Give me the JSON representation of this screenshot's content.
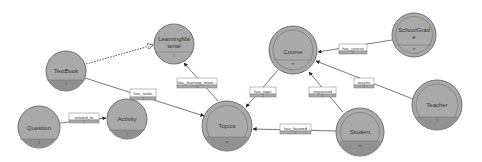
{
  "diagram": {
    "type": "entity-relationship graph",
    "colors": {
      "node_fill": "#a9a9a9",
      "node_stroke": "#6f6f6f",
      "node_bottom": "#8f8f8f",
      "edge": "#555555",
      "label_box_fill": "#ffffff",
      "label_box_stroke": "#7a7a7a"
    },
    "nodes": [
      {
        "id": "textbook",
        "label": "TextBook",
        "sub": "1",
        "double": false
      },
      {
        "id": "learningmaterial",
        "label_line1": "LearningMa",
        "label_line2": "terial",
        "sub": "1",
        "double": false
      },
      {
        "id": "course",
        "label": "Course",
        "sub": "m",
        "double": true
      },
      {
        "id": "schoolgrade",
        "label_line1": "SchoolGrad",
        "label_line2": "e",
        "sub": "m",
        "double": true
      },
      {
        "id": "question",
        "label": "Question",
        "sub": "1",
        "double": false
      },
      {
        "id": "activity",
        "label": "Activity",
        "sub": "1",
        "double": false
      },
      {
        "id": "topics",
        "label": "Topics",
        "sub": "m",
        "double": true
      },
      {
        "id": "student",
        "label": "Student",
        "sub": "m",
        "double": true
      },
      {
        "id": "teacher",
        "label": "Teacher",
        "sub": "1",
        "double": true
      }
    ],
    "edges": [
      {
        "from": "textbook",
        "to": "learningmaterial",
        "label": "",
        "style": "dashed"
      },
      {
        "from": "textbook",
        "to": "topics",
        "label": "has_tasks",
        "card": "1"
      },
      {
        "from": "question",
        "to": "activity",
        "label": "related_to",
        "card": "1"
      },
      {
        "from": "topics",
        "to": "learningmaterial",
        "label": "has_learning_mate...",
        "card": "1"
      },
      {
        "from": "course",
        "to": "topics",
        "label": "has_topic",
        "card": "1"
      },
      {
        "from": "schoolgrade",
        "to": "course",
        "label": "has_course",
        "card": "1"
      },
      {
        "from": "teacher",
        "to": "course",
        "label": "teachs",
        "card": "1"
      },
      {
        "from": "student",
        "to": "course",
        "label": "registered",
        "card": "1"
      },
      {
        "from": "student",
        "to": "topics",
        "label": "has_learned",
        "card": "1"
      }
    ]
  }
}
